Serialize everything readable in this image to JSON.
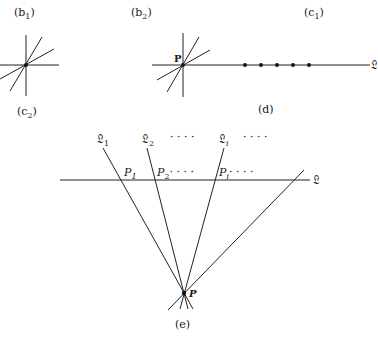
{
  "panels": {
    "b1": {
      "label": "(b",
      "sub": "1",
      "close": ")"
    },
    "b2": {
      "label": "(b",
      "sub": "2",
      "close": ")",
      "point_label": "P"
    },
    "c1": {
      "label": "(c",
      "sub": "1",
      "close": ")"
    },
    "c2": {
      "label": "(c",
      "sub": "2",
      "close": ")"
    },
    "d": {
      "label": "(d)",
      "line_label": "𝔏",
      "dot_count": 5
    },
    "e": {
      "label": "(e)",
      "line_label": "𝔏",
      "point_label": "P",
      "lines": [
        {
          "name": "𝔏",
          "sub": "1"
        },
        {
          "name": "𝔏",
          "sub": "2"
        },
        {
          "name": "𝔏",
          "sub": "i"
        }
      ],
      "line_ellipsis_1": "· · · ·",
      "line_ellipsis_2": "· · · ·",
      "points": [
        {
          "name": "P",
          "sub": "1"
        },
        {
          "name": "P",
          "sub": "2",
          "trail": "· · · ·"
        },
        {
          "name": "P",
          "sub": "i",
          "trail": "· · · ·"
        }
      ]
    }
  }
}
